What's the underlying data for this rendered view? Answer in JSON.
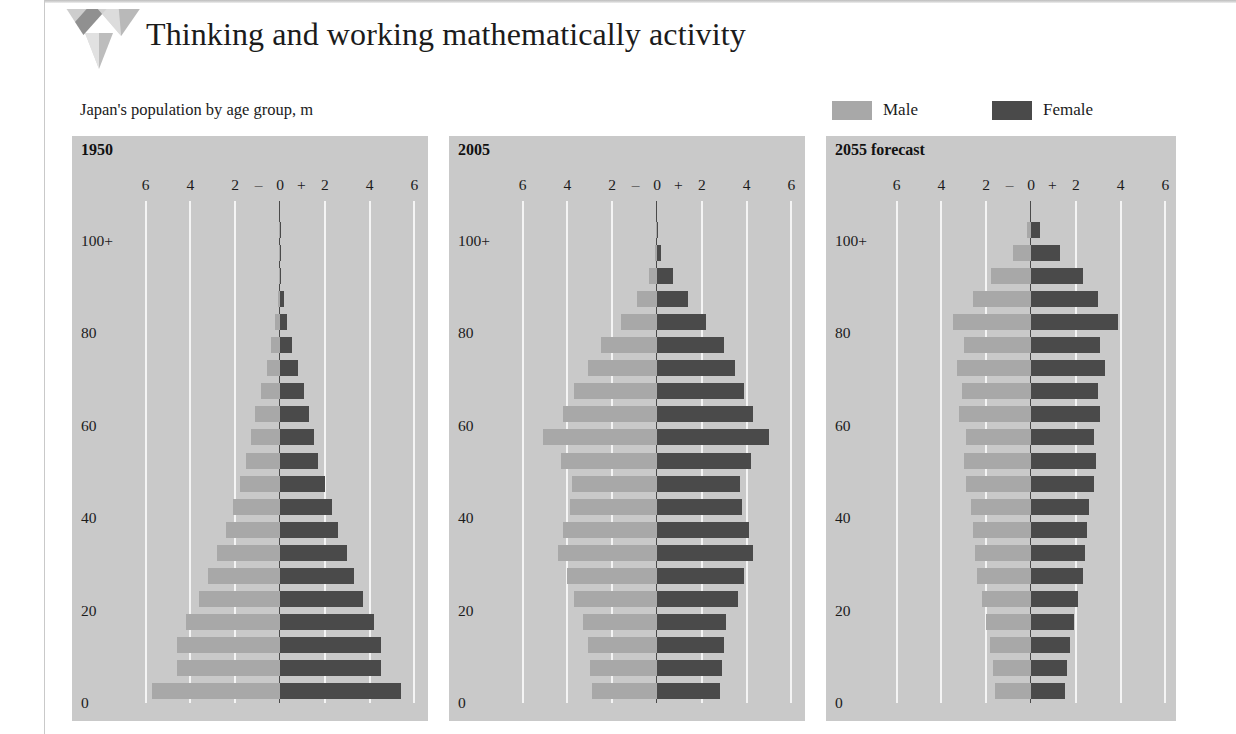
{
  "header": {
    "title": "Thinking and working mathematically activity",
    "logo_icon": "triangle-chevron-logo"
  },
  "subtitle": "Japan's population by age group, m",
  "legend": {
    "items": [
      {
        "label": "Male",
        "color": "#a8a8a8",
        "key": "male"
      },
      {
        "label": "Female",
        "color": "#4a4a4a",
        "key": "female"
      }
    ]
  },
  "colors": {
    "male": "#a8a8a8",
    "female": "#4a4a4a",
    "panel_bg": "#c9c9c9",
    "gridline": "#f4f4f4",
    "zero_line": "#4a4a4a",
    "page_bg": "#ffffff"
  },
  "axis": {
    "x_ticks": [
      "6",
      "4",
      "2",
      "0",
      "2",
      "4",
      "6"
    ],
    "x_values": [
      -6,
      -4,
      -2,
      0,
      2,
      4,
      6
    ],
    "minus_sign": "–",
    "plus_sign": "+",
    "x_label_left": "–",
    "x_label_right": "+",
    "xlim": [
      -7,
      7
    ],
    "y_ticks": [
      "100+",
      "80",
      "60",
      "40",
      "20",
      "0"
    ],
    "y_values": [
      100,
      80,
      60,
      40,
      20,
      0
    ],
    "ylim": [
      0,
      105
    ]
  },
  "chart_data": {
    "type": "bar",
    "subtype": "population-pyramid",
    "title": "Japan's population by age group, m",
    "xlabel": "Population, m",
    "ylabel": "Age group",
    "xlim": [
      -7,
      7
    ],
    "ylim": [
      0,
      105
    ],
    "grid": true,
    "legend_position": "top-right",
    "units": "millions",
    "age_groups": [
      "0-4",
      "5-9",
      "10-14",
      "15-19",
      "20-24",
      "25-29",
      "30-34",
      "35-39",
      "40-44",
      "45-49",
      "50-54",
      "55-59",
      "60-64",
      "65-69",
      "70-74",
      "75-79",
      "80-84",
      "85-89",
      "90-94",
      "95-99",
      "100+"
    ],
    "panels": [
      {
        "label": "1950",
        "series": [
          {
            "name": "Male",
            "values": [
              5.7,
              4.6,
              4.6,
              4.2,
              3.6,
              3.2,
              2.8,
              2.4,
              2.1,
              1.8,
              1.5,
              1.3,
              1.1,
              0.85,
              0.6,
              0.4,
              0.22,
              0.1,
              0.03,
              0.006,
              0.001
            ]
          },
          {
            "name": "Female",
            "values": [
              5.4,
              4.5,
              4.5,
              4.2,
              3.7,
              3.3,
              3.0,
              2.6,
              2.3,
              2.0,
              1.7,
              1.5,
              1.3,
              1.05,
              0.8,
              0.55,
              0.32,
              0.16,
              0.05,
              0.01,
              0.002
            ]
          }
        ]
      },
      {
        "label": "2005",
        "series": [
          {
            "name": "Male",
            "values": [
              2.9,
              3.0,
              3.1,
              3.3,
              3.7,
              4.0,
              4.4,
              4.2,
              3.9,
              3.8,
              4.3,
              5.1,
              4.2,
              3.7,
              3.1,
              2.5,
              1.6,
              0.9,
              0.35,
              0.07,
              0.006
            ]
          },
          {
            "name": "Female",
            "values": [
              2.8,
              2.9,
              3.0,
              3.1,
              3.6,
              3.9,
              4.3,
              4.1,
              3.8,
              3.7,
              4.2,
              5.0,
              4.3,
              3.9,
              3.5,
              3.0,
              2.2,
              1.4,
              0.7,
              0.2,
              0.03
            ]
          }
        ]
      },
      {
        "label": "2055 forecast",
        "series": [
          {
            "name": "Male",
            "values": [
              1.6,
              1.7,
              1.85,
              2.0,
              2.2,
              2.4,
              2.5,
              2.6,
              2.7,
              2.9,
              3.0,
              2.9,
              3.2,
              3.1,
              3.3,
              3.0,
              3.5,
              2.6,
              1.8,
              0.8,
              0.2
            ]
          },
          {
            "name": "Female",
            "values": [
              1.5,
              1.6,
              1.75,
              1.9,
              2.1,
              2.3,
              2.4,
              2.5,
              2.6,
              2.8,
              2.9,
              2.8,
              3.1,
              3.0,
              3.3,
              3.1,
              3.9,
              3.0,
              2.3,
              1.3,
              0.4
            ]
          }
        ]
      }
    ]
  },
  "panels_layout": [
    {
      "label": "1950",
      "left": 72,
      "width": 356
    },
    {
      "label": "2005",
      "left": 449,
      "width": 356
    },
    {
      "label": "2055 forecast",
      "left": 826,
      "width": 350
    }
  ]
}
